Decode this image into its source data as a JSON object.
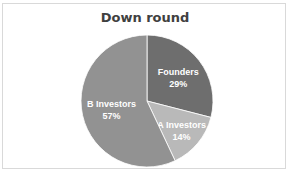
{
  "chart_data": {
    "type": "pie",
    "title": "Down round",
    "categories": [
      "Founders",
      "A Investors",
      "B Investors"
    ],
    "values": [
      29,
      14,
      57
    ],
    "labels": [
      "29%",
      "14%",
      "57%"
    ],
    "colors": [
      "#6e6e6e",
      "#b9b9b9",
      "#929292"
    ],
    "start_angle_deg": 0,
    "direction": "clockwise",
    "legend": "none",
    "data_labels": "inside"
  }
}
